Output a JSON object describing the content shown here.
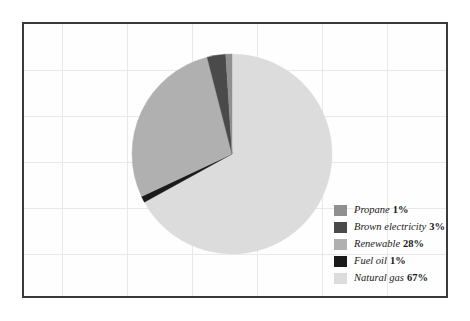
{
  "chart_data": {
    "type": "pie",
    "title": "",
    "xlabel": "",
    "ylabel": "",
    "grid": true,
    "legend_position": "bottom-right",
    "units": "percent",
    "start_angle_deg": 0,
    "direction": "clockwise",
    "categories": [
      "Natural gas",
      "Fuel oil",
      "Renewable",
      "Brown electricity",
      "Propane"
    ],
    "values": [
      67,
      1,
      28,
      3,
      1
    ],
    "slices": [
      {
        "label": "Natural gas",
        "value": 67,
        "value_text": "67%",
        "color": "#dcdcdc"
      },
      {
        "label": "Fuel oil",
        "value": 1,
        "value_text": "1%",
        "color": "#1a1a1a"
      },
      {
        "label": "Renewable",
        "value": 28,
        "value_text": "28%",
        "color": "#b0b0b0"
      },
      {
        "label": "Brown electricity",
        "value": 3,
        "value_text": "3%",
        "color": "#4a4a4a"
      },
      {
        "label": "Propane",
        "value": 1,
        "value_text": "1%",
        "color": "#909090"
      }
    ],
    "legend_entries": [
      {
        "label": "Propane",
        "value_text": "1%",
        "color": "#909090"
      },
      {
        "label": "Brown electricity",
        "value_text": "3%",
        "color": "#4a4a4a"
      },
      {
        "label": "Renewable",
        "value_text": "28%",
        "color": "#b0b0b0"
      },
      {
        "label": "Fuel oil",
        "value_text": "1%",
        "color": "#1a1a1a"
      },
      {
        "label": "Natural gas",
        "value_text": "67%",
        "color": "#dcdcdc"
      }
    ]
  },
  "figure": {
    "frame_color": "#3a3a3c",
    "grid_color": "#e9e9e9",
    "background": "#ffffff",
    "pie": {
      "cx": 208,
      "cy": 130,
      "r": 100
    },
    "grid_v": [
      38,
      103,
      168,
      233,
      298,
      363
    ],
    "grid_h": [
      46,
      92,
      138,
      184,
      230
    ]
  }
}
